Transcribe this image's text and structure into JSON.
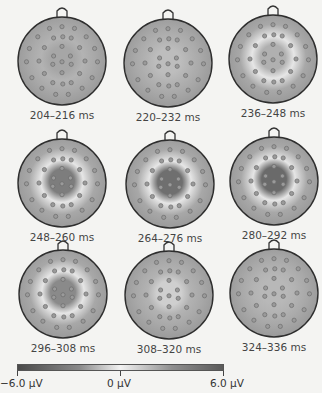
{
  "figure": {
    "maps": [
      {
        "label": "204–216 ms",
        "x": 14,
        "y": 3,
        "center_shade": "#a6a6a6",
        "ring": false
      },
      {
        "label": "220–232 ms",
        "x": 120,
        "y": 5,
        "center_shade": "#bdbdbd",
        "ring": false
      },
      {
        "label": "236–248 ms",
        "x": 225,
        "y": 1,
        "center_shade": "#b0b0b0",
        "ring": true
      },
      {
        "label": "248–260 ms",
        "x": 14,
        "y": 125,
        "center_shade": "#7d7d7d",
        "ring": true
      },
      {
        "label": "264–276 ms",
        "x": 122,
        "y": 126,
        "center_shade": "#6f6f6f",
        "ring": true
      },
      {
        "label": "280–292 ms",
        "x": 226,
        "y": 123,
        "center_shade": "#6a6a6a",
        "ring": true
      },
      {
        "label": "296–308 ms",
        "x": 15,
        "y": 236,
        "center_shade": "#8a8a8a",
        "ring": true
      },
      {
        "label": "308–320 ms",
        "x": 121,
        "y": 237,
        "center_shade": "#cfcfcf",
        "ring": false
      },
      {
        "label": "324–336 ms",
        "x": 226,
        "y": 235,
        "center_shade": "#b8b8b8",
        "ring": false
      }
    ],
    "colorbar": {
      "min_label": "−6.0 µV",
      "mid_label": "0 µV",
      "max_label": "6.0 µV"
    }
  }
}
